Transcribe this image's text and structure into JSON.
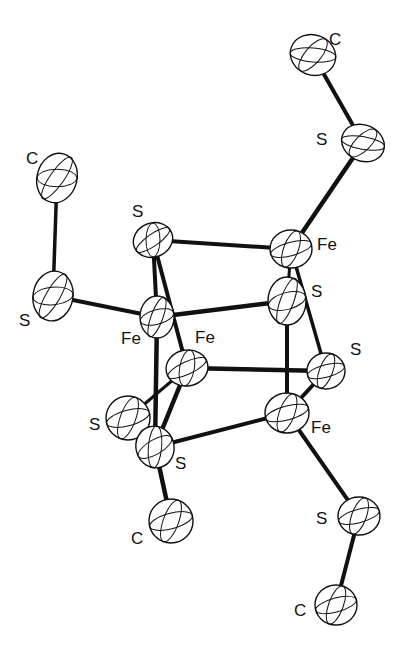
{
  "diagram": {
    "title": "",
    "type": "ORTEP molecular structure",
    "atoms": [
      {
        "id": "c1",
        "element": "C",
        "label": "C",
        "x": 313,
        "y": 55,
        "rx": 23,
        "ry": 20,
        "rot": 20,
        "lx": 329,
        "ly": 45
      },
      {
        "id": "s1",
        "element": "S",
        "label": "S",
        "x": 363,
        "y": 143,
        "rx": 22,
        "ry": 18,
        "rot": 25,
        "lx": 316,
        "ly": 145
      },
      {
        "id": "fe1",
        "element": "Fe",
        "label": "Fe",
        "x": 291,
        "y": 249,
        "rx": 21,
        "ry": 19,
        "rot": 0,
        "lx": 317,
        "ly": 250
      },
      {
        "id": "s2",
        "element": "S",
        "label": "S",
        "x": 153,
        "y": 240,
        "rx": 20,
        "ry": 17,
        "rot": -20,
        "lx": 132,
        "ly": 217
      },
      {
        "id": "c2",
        "element": "C",
        "label": "C",
        "x": 57,
        "y": 178,
        "rx": 20,
        "ry": 25,
        "rot": 15,
        "lx": 26,
        "ly": 164
      },
      {
        "id": "s3",
        "element": "S",
        "label": "S",
        "x": 53,
        "y": 296,
        "rx": 20,
        "ry": 25,
        "rot": 10,
        "lx": 19,
        "ly": 326
      },
      {
        "id": "fe2",
        "element": "Fe",
        "label": "Fe",
        "x": 157,
        "y": 317,
        "rx": 17,
        "ry": 21,
        "rot": 0,
        "lx": 121,
        "ly": 344
      },
      {
        "id": "s4",
        "element": "S",
        "label": "S",
        "x": 287,
        "y": 301,
        "rx": 19,
        "ry": 24,
        "rot": 0,
        "lx": 311,
        "ly": 297
      },
      {
        "id": "fe3",
        "element": "Fe",
        "label": "Fe",
        "x": 187,
        "y": 368,
        "rx": 21,
        "ry": 18,
        "rot": -10,
        "lx": 195,
        "ly": 343
      },
      {
        "id": "s5",
        "element": "S",
        "label": "S",
        "x": 326,
        "y": 371,
        "rx": 19,
        "ry": 18,
        "rot": 0,
        "lx": 350,
        "ly": 355
      },
      {
        "id": "s6",
        "element": "S",
        "label": "S",
        "x": 128,
        "y": 418,
        "rx": 22,
        "ry": 22,
        "rot": 0,
        "lx": 89,
        "ly": 430
      },
      {
        "id": "s7",
        "element": "S",
        "label": "S",
        "x": 155,
        "y": 447,
        "rx": 19,
        "ry": 21,
        "rot": -15,
        "lx": 175,
        "ly": 469
      },
      {
        "id": "fe4",
        "element": "Fe",
        "label": "Fe",
        "x": 287,
        "y": 413,
        "rx": 22,
        "ry": 20,
        "rot": 0,
        "lx": 311,
        "ly": 433
      },
      {
        "id": "c3",
        "element": "C",
        "label": "C",
        "x": 171,
        "y": 521,
        "rx": 22,
        "ry": 22,
        "rot": 0,
        "lx": 131,
        "ly": 544
      },
      {
        "id": "s8",
        "element": "S",
        "label": "S",
        "x": 359,
        "y": 516,
        "rx": 21,
        "ry": 19,
        "rot": 0,
        "lx": 316,
        "ly": 524
      },
      {
        "id": "c4",
        "element": "C",
        "label": "C",
        "x": 336,
        "y": 605,
        "rx": 21,
        "ry": 20,
        "rot": 0,
        "lx": 294,
        "ly": 616
      }
    ],
    "bonds": [
      {
        "from": "c1",
        "to": "s1",
        "w": 4
      },
      {
        "from": "s1",
        "to": "fe1",
        "w": 4.5
      },
      {
        "from": "c2",
        "to": "s3",
        "w": 3.5
      },
      {
        "from": "s3",
        "to": "fe2",
        "w": 4
      },
      {
        "from": "s2",
        "to": "fe1",
        "w": 4
      },
      {
        "from": "s2",
        "to": "fe2",
        "w": 4
      },
      {
        "from": "s2",
        "to": "fe3",
        "w": 4
      },
      {
        "from": "fe2",
        "to": "s4",
        "w": 4.5
      },
      {
        "from": "fe1",
        "to": "s4",
        "w": 3
      },
      {
        "from": "fe1",
        "to": "s5",
        "w": 3.5
      },
      {
        "from": "fe3",
        "to": "s5",
        "w": 4.5
      },
      {
        "from": "s4",
        "to": "fe4",
        "w": 4
      },
      {
        "from": "s5",
        "to": "fe4",
        "w": 4
      },
      {
        "from": "fe2",
        "to": "s7",
        "w": 4.5
      },
      {
        "from": "fe3",
        "to": "s7",
        "w": 4.5
      },
      {
        "from": "fe3",
        "to": "s6",
        "w": 3
      },
      {
        "from": "s7",
        "to": "fe4",
        "w": 4
      },
      {
        "from": "s7",
        "to": "c3",
        "w": 4.5
      },
      {
        "from": "fe4",
        "to": "s8",
        "w": 4
      },
      {
        "from": "s8",
        "to": "c4",
        "w": 4
      }
    ],
    "colors": {
      "ink": "#111111",
      "background": "#ffffff"
    }
  }
}
